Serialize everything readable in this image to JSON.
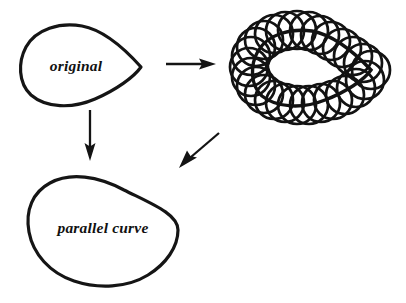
{
  "figure": {
    "background_color": "#ffffff",
    "ink_color": "#141414",
    "labels": {
      "original": "original",
      "parallel_curve": "parallel curve"
    },
    "shapes": {
      "original_curve": {
        "name": "original teardrop curve",
        "description": "closed convex teardrop, round at left, tapering to a blunt tip at right",
        "stroke_width": 3.2,
        "center": [
          82,
          67
        ],
        "tip": [
          141,
          67
        ]
      },
      "circle_family": {
        "name": "family of equal circles centered on the original curve",
        "circle_count": 26,
        "circle_radius": 19,
        "stroke_width": 2.7,
        "bounds": [
          232,
          17,
          390,
          122
        ],
        "inner_hole": "lens shaped white region forming the inner envelope"
      },
      "parallel_curve": {
        "name": "parallel (offset) curve",
        "description": "egg shaped outer envelope of the circle family, the tip of the original is rounded off",
        "stroke_width": 3.2,
        "center": [
          103,
          231
        ]
      }
    },
    "arrows": [
      {
        "name": "arrow-original-to-circles",
        "direction": "right",
        "from": [
          166,
          64
        ],
        "to": [
          216,
          64
        ]
      },
      {
        "name": "arrow-original-to-parallel",
        "direction": "down",
        "from": [
          90,
          110
        ],
        "to": [
          90,
          160
        ]
      },
      {
        "name": "arrow-circles-to-parallel",
        "direction": "down-left",
        "from": [
          219,
          133
        ],
        "to": [
          180,
          167
        ]
      }
    ]
  }
}
